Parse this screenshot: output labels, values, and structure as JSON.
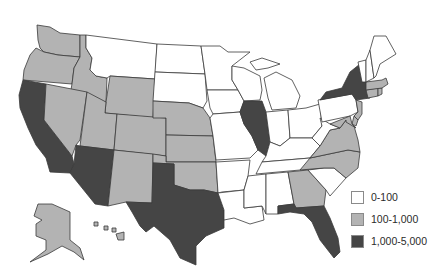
{
  "map": {
    "title": "",
    "region": "United States",
    "categories": [
      {
        "key": "low",
        "label": "0-100",
        "color": "#ffffff"
      },
      {
        "key": "mid",
        "label": "100-1,000",
        "color": "#b3b3b3"
      },
      {
        "key": "high",
        "label": "1,000-5,000",
        "color": "#454545"
      }
    ],
    "states": {
      "WA": "mid",
      "OR": "mid",
      "CA": "high",
      "ID": "mid",
      "NV": "mid",
      "MT": "low",
      "WY": "mid",
      "UT": "mid",
      "AZ": "high",
      "CO": "mid",
      "NM": "mid",
      "ND": "low",
      "SD": "low",
      "NE": "mid",
      "KS": "mid",
      "OK": "mid",
      "TX": "high",
      "MN": "low",
      "IA": "low",
      "MO": "low",
      "AR": "low",
      "LA": "low",
      "WI": "low",
      "IL": "high",
      "MI": "low",
      "IN": "low",
      "OH": "low",
      "KY": "low",
      "TN": "low",
      "MS": "low",
      "AL": "low",
      "GA": "mid",
      "FL": "high",
      "SC": "low",
      "NC": "mid",
      "VA": "mid",
      "WV": "low",
      "PA": "low",
      "NY": "high",
      "NJ": "mid",
      "DE": "mid",
      "MD": "mid",
      "CT": "mid",
      "RI": "mid",
      "MA": "mid",
      "VT": "low",
      "NH": "low",
      "ME": "low",
      "AK": "mid",
      "HI": "mid"
    }
  },
  "legend": {
    "items": [
      {
        "label": "0-100",
        "color": "#ffffff"
      },
      {
        "label": "100-1,000",
        "color": "#b3b3b3"
      },
      {
        "label": "1,000-5,000",
        "color": "#454545"
      }
    ]
  }
}
